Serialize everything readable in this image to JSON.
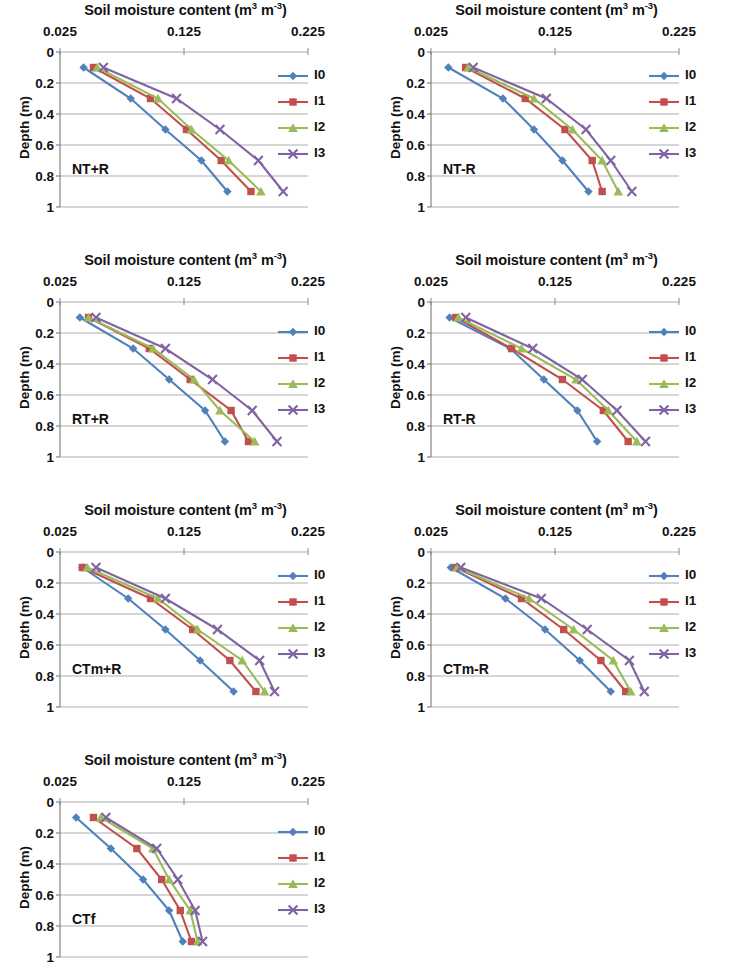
{
  "figure": {
    "axis_title": "Soil moisture content (m3 m-3)",
    "axis_title_main": "Soil moisture content (m",
    "axis_title_sup1": "3",
    "axis_title_mid": " m",
    "axis_title_sup2": "-3",
    "axis_title_end": ")",
    "y_axis_label": "Depth (m)",
    "x_ticks": [
      "0.025",
      "0.125",
      "0.225"
    ],
    "y_ticks": [
      "0",
      "0.2",
      "0.4",
      "0.6",
      "0.8",
      "1"
    ],
    "series_names": [
      "I0",
      "I1",
      "I2",
      "I3"
    ],
    "series_colors": [
      "#4f81bd",
      "#c0504d",
      "#9bbb59",
      "#8064a2"
    ],
    "series_markers": [
      "diamond",
      "square",
      "triangle",
      "cross"
    ]
  },
  "chart_data": [
    {
      "type": "line",
      "title": "Soil moisture content (m3 m-3)",
      "panel_label": "NT+R",
      "xlabel": "Soil moisture content (m3 m-3)",
      "ylabel": "Depth (m)",
      "xlim": [
        0.025,
        0.225
      ],
      "ylim": [
        0,
        1
      ],
      "y_inverted": true,
      "grid": true,
      "legend": "right-top",
      "depths": [
        0.1,
        0.3,
        0.5,
        0.7,
        0.9
      ],
      "series": [
        {
          "name": "I0",
          "color": "#4f81bd",
          "marker": "diamond",
          "values": [
            0.044,
            0.082,
            0.11,
            0.139,
            0.16
          ]
        },
        {
          "name": "I1",
          "color": "#c0504d",
          "marker": "square",
          "values": [
            0.052,
            0.098,
            0.127,
            0.155,
            0.179
          ]
        },
        {
          "name": "I2",
          "color": "#9bbb59",
          "marker": "triangle",
          "values": [
            0.055,
            0.104,
            0.131,
            0.161,
            0.187
          ]
        },
        {
          "name": "I3",
          "color": "#8064a2",
          "marker": "cross",
          "values": [
            0.06,
            0.119,
            0.154,
            0.185,
            0.205
          ]
        }
      ]
    },
    {
      "type": "line",
      "title": "Soil moisture content (m3 m-3)",
      "panel_label": "NT-R",
      "xlabel": "Soil moisture content (m3 m-3)",
      "ylabel": "Depth (m)",
      "xlim": [
        0.025,
        0.225
      ],
      "ylim": [
        0,
        1
      ],
      "y_inverted": true,
      "grid": true,
      "legend": "right-top",
      "depths": [
        0.1,
        0.3,
        0.5,
        0.7,
        0.9
      ],
      "series": [
        {
          "name": "I0",
          "color": "#4f81bd",
          "marker": "diamond",
          "values": [
            0.039,
            0.083,
            0.108,
            0.131,
            0.152
          ]
        },
        {
          "name": "I1",
          "color": "#c0504d",
          "marker": "square",
          "values": [
            0.053,
            0.101,
            0.133,
            0.155,
            0.163
          ]
        },
        {
          "name": "I2",
          "color": "#9bbb59",
          "marker": "triangle",
          "values": [
            0.055,
            0.108,
            0.139,
            0.163,
            0.176
          ]
        },
        {
          "name": "I3",
          "color": "#8064a2",
          "marker": "cross",
          "values": [
            0.059,
            0.118,
            0.15,
            0.17,
            0.187
          ]
        }
      ]
    },
    {
      "type": "line",
      "title": "Soil moisture content (m3 m-3)",
      "panel_label": "RT+R",
      "xlabel": "Soil moisture content (m3 m-3)",
      "ylabel": "Depth (m)",
      "xlim": [
        0.025,
        0.225
      ],
      "ylim": [
        0,
        1
      ],
      "y_inverted": true,
      "grid": true,
      "legend": "right-middle",
      "depths": [
        0.1,
        0.3,
        0.5,
        0.7,
        0.9
      ],
      "series": [
        {
          "name": "I0",
          "color": "#4f81bd",
          "marker": "diamond",
          "values": [
            0.041,
            0.084,
            0.113,
            0.142,
            0.158
          ]
        },
        {
          "name": "I1",
          "color": "#c0504d",
          "marker": "square",
          "values": [
            0.048,
            0.097,
            0.13,
            0.163,
            0.177
          ]
        },
        {
          "name": "I2",
          "color": "#9bbb59",
          "marker": "triangle",
          "values": [
            0.048,
            0.1,
            0.133,
            0.154,
            0.182
          ]
        },
        {
          "name": "I3",
          "color": "#8064a2",
          "marker": "cross",
          "values": [
            0.054,
            0.11,
            0.148,
            0.18,
            0.2
          ]
        }
      ]
    },
    {
      "type": "line",
      "title": "Soil moisture content (m3 m-3)",
      "panel_label": "RT-R",
      "xlabel": "Soil moisture content (m3 m-3)",
      "ylabel": "Depth (m)",
      "xlim": [
        0.025,
        0.225
      ],
      "ylim": [
        0,
        1
      ],
      "y_inverted": true,
      "grid": true,
      "legend": "right-middle",
      "depths": [
        0.1,
        0.3,
        0.5,
        0.7,
        0.9
      ],
      "series": [
        {
          "name": "I0",
          "color": "#4f81bd",
          "marker": "diamond",
          "values": [
            0.04,
            0.089,
            0.116,
            0.143,
            0.159
          ]
        },
        {
          "name": "I1",
          "color": "#c0504d",
          "marker": "square",
          "values": [
            0.045,
            0.09,
            0.131,
            0.164,
            0.184
          ]
        },
        {
          "name": "I2",
          "color": "#9bbb59",
          "marker": "triangle",
          "values": [
            0.047,
            0.098,
            0.142,
            0.168,
            0.191
          ]
        },
        {
          "name": "I3",
          "color": "#8064a2",
          "marker": "cross",
          "values": [
            0.053,
            0.107,
            0.147,
            0.175,
            0.198
          ]
        }
      ]
    },
    {
      "type": "line",
      "title": "Soil moisture content (m3 m-3)",
      "panel_label": "CTm+R",
      "xlabel": "Soil moisture content (m3 m-3)",
      "ylabel": "Depth (m)",
      "xlim": [
        0.025,
        0.225
      ],
      "ylim": [
        0,
        1
      ],
      "y_inverted": true,
      "grid": true,
      "legend": "right-top",
      "depths": [
        0.1,
        0.3,
        0.5,
        0.7,
        0.9
      ],
      "series": [
        {
          "name": "I0",
          "color": "#4f81bd",
          "marker": "diamond",
          "values": [
            0.043,
            0.08,
            0.11,
            0.138,
            0.165
          ]
        },
        {
          "name": "I1",
          "color": "#c0504d",
          "marker": "square",
          "values": [
            0.043,
            0.098,
            0.132,
            0.162,
            0.183
          ]
        },
        {
          "name": "I2",
          "color": "#9bbb59",
          "marker": "triangle",
          "values": [
            0.047,
            0.104,
            0.136,
            0.172,
            0.19
          ]
        },
        {
          "name": "I3",
          "color": "#8064a2",
          "marker": "cross",
          "values": [
            0.054,
            0.11,
            0.152,
            0.186,
            0.198
          ]
        }
      ]
    },
    {
      "type": "line",
      "title": "Soil moisture content (m3 m-3)",
      "panel_label": "CTm-R",
      "xlabel": "Soil moisture content (m3 m-3)",
      "ylabel": "Depth (m)",
      "xlim": [
        0.025,
        0.225
      ],
      "ylim": [
        0,
        1
      ],
      "y_inverted": true,
      "grid": true,
      "legend": "right-top",
      "depths": [
        0.1,
        0.3,
        0.5,
        0.7,
        0.9
      ],
      "series": [
        {
          "name": "I0",
          "color": "#4f81bd",
          "marker": "diamond",
          "values": [
            0.041,
            0.085,
            0.117,
            0.145,
            0.17
          ]
        },
        {
          "name": "I1",
          "color": "#c0504d",
          "marker": "square",
          "values": [
            0.045,
            0.098,
            0.132,
            0.162,
            0.182
          ]
        },
        {
          "name": "I2",
          "color": "#9bbb59",
          "marker": "triangle",
          "values": [
            0.046,
            0.104,
            0.14,
            0.172,
            0.186
          ]
        },
        {
          "name": "I3",
          "color": "#8064a2",
          "marker": "cross",
          "values": [
            0.049,
            0.114,
            0.151,
            0.185,
            0.197
          ]
        }
      ]
    },
    {
      "type": "line",
      "title": "Soil moisture content (m3 m-3)",
      "panel_label": "CTf",
      "xlabel": "Soil moisture content (m3 m-3)",
      "ylabel": "Depth (m)",
      "xlim": [
        0.025,
        0.225
      ],
      "ylim": [
        0,
        1
      ],
      "y_inverted": true,
      "grid": true,
      "legend": "right-middle",
      "depths": [
        0.1,
        0.3,
        0.5,
        0.7,
        0.9
      ],
      "series": [
        {
          "name": "I0",
          "color": "#4f81bd",
          "marker": "diamond",
          "values": [
            0.038,
            0.066,
            0.092,
            0.113,
            0.124
          ]
        },
        {
          "name": "I1",
          "color": "#c0504d",
          "marker": "square",
          "values": [
            0.052,
            0.087,
            0.107,
            0.122,
            0.131
          ]
        },
        {
          "name": "I2",
          "color": "#9bbb59",
          "marker": "triangle",
          "values": [
            0.058,
            0.1,
            0.113,
            0.13,
            0.136
          ]
        },
        {
          "name": "I3",
          "color": "#8064a2",
          "marker": "cross",
          "values": [
            0.062,
            0.103,
            0.12,
            0.134,
            0.14
          ]
        }
      ]
    }
  ],
  "panel_positions": [
    {
      "left": 0,
      "top": 0
    },
    {
      "left": 371,
      "top": 0
    },
    {
      "left": 0,
      "top": 250
    },
    {
      "left": 371,
      "top": 250
    },
    {
      "left": 0,
      "top": 500
    },
    {
      "left": 371,
      "top": 500
    },
    {
      "left": 0,
      "top": 750
    }
  ]
}
